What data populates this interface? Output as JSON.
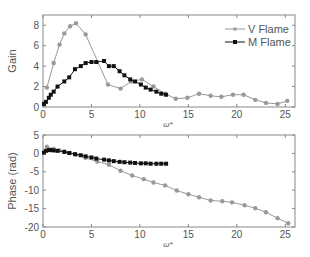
{
  "chart_data": [
    {
      "type": "line",
      "title": "",
      "xlabel": "ω*",
      "ylabel": "Gain",
      "xlim": [
        0,
        26
      ],
      "ylim": [
        0,
        9
      ],
      "xticks": [
        0,
        5,
        10,
        15,
        20,
        25
      ],
      "yticks": [
        0,
        2,
        4,
        6,
        8
      ],
      "grid": false,
      "legend_position": "upper right",
      "legend": [
        "V Flame",
        "M Flame"
      ],
      "series": [
        {
          "name": "V Flame",
          "color": "#999999",
          "marker": "circle",
          "x": [
            0.4,
            1.1,
            1.7,
            2.2,
            2.8,
            3.4,
            4.4,
            6.7,
            8.0,
            9.1,
            10.2,
            11.4,
            12.6,
            13.7,
            14.9,
            16.1,
            17.3,
            18.4,
            19.6,
            20.7,
            21.9,
            23.0,
            24.2,
            25.2
          ],
          "y": [
            1.9,
            4.3,
            6.1,
            7.2,
            7.9,
            8.2,
            7.1,
            2.2,
            1.8,
            2.5,
            2.7,
            2.0,
            1.3,
            0.8,
            0.9,
            1.3,
            1.1,
            1.0,
            1.2,
            1.2,
            0.7,
            0.4,
            0.3,
            0.6
          ]
        },
        {
          "name": "M Flame",
          "color": "#111111",
          "marker": "square",
          "x": [
            0.1,
            0.3,
            0.6,
            0.8,
            1.1,
            1.5,
            2.2,
            2.7,
            3.3,
            3.9,
            4.4,
            5.0,
            5.5,
            6.3,
            6.8,
            7.3,
            7.9,
            8.4,
            9.0,
            9.5,
            10.1,
            10.6,
            11.1,
            11.7,
            12.2,
            12.7
          ],
          "y": [
            0.3,
            0.5,
            0.9,
            1.2,
            1.5,
            2.0,
            2.5,
            2.9,
            3.7,
            4.0,
            4.3,
            4.4,
            4.4,
            4.5,
            4.0,
            4.0,
            3.5,
            3.1,
            2.7,
            2.5,
            2.2,
            1.9,
            1.7,
            1.5,
            1.3,
            1.2
          ]
        }
      ]
    },
    {
      "type": "line",
      "title": "",
      "xlabel": "ω*",
      "ylabel": "Phase (rad)",
      "xlim": [
        0,
        26
      ],
      "ylim": [
        -20,
        5
      ],
      "xticks": [
        0,
        5,
        10,
        15,
        20,
        25
      ],
      "yticks": [
        5,
        0,
        -5,
        -10,
        -15,
        -20
      ],
      "grid": false,
      "series": [
        {
          "name": "V Flame",
          "color": "#999999",
          "marker": "circle",
          "x": [
            0.4,
            1.1,
            1.7,
            2.2,
            2.8,
            3.4,
            4.4,
            5.6,
            6.8,
            8.0,
            9.2,
            10.4,
            11.4,
            12.6,
            13.8,
            15.0,
            16.1,
            17.3,
            18.5,
            19.5,
            20.8,
            21.9,
            23.0,
            24.2,
            25.3
          ],
          "y": [
            1.8,
            1.2,
            0.8,
            0.5,
            0.1,
            -0.4,
            -1.2,
            -2.2,
            -3.1,
            -4.7,
            -6.0,
            -7.0,
            -7.9,
            -8.7,
            -10.1,
            -11.1,
            -11.9,
            -12.8,
            -13.0,
            -13.3,
            -14.1,
            -14.9,
            -16.0,
            -17.6,
            -19.0
          ]
        },
        {
          "name": "M Flame",
          "color": "#111111",
          "marker": "square",
          "x": [
            0.1,
            0.3,
            0.6,
            0.8,
            1.1,
            1.5,
            2.2,
            2.7,
            3.3,
            3.9,
            4.4,
            5.0,
            5.5,
            6.3,
            6.8,
            7.3,
            7.9,
            8.4,
            9.0,
            9.5,
            10.1,
            10.6,
            11.1,
            11.7,
            12.2,
            12.7
          ],
          "y": [
            0.2,
            0.7,
            0.9,
            0.9,
            0.8,
            0.7,
            0.4,
            0.1,
            -0.2,
            -0.5,
            -0.8,
            -1.1,
            -1.4,
            -1.7,
            -1.9,
            -2.1,
            -2.3,
            -2.4,
            -2.5,
            -2.6,
            -2.7,
            -2.7,
            -2.8,
            -2.8,
            -2.8,
            -2.8
          ]
        }
      ]
    }
  ]
}
